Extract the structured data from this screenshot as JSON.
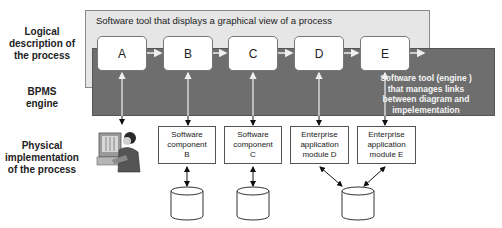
{
  "rows": {
    "logical": "Logical description of the process",
    "logical_lines": [
      "Logical",
      "description of",
      "the process"
    ],
    "engine_lines": [
      "BPMS",
      "engine"
    ],
    "physical_lines": [
      "Physical",
      "implementation",
      "of the process"
    ]
  },
  "tool_panel": {
    "title": "Software tool that displays a graphical view  of a process"
  },
  "engine": {
    "description_lines": [
      "Software tool  (engine )",
      "that manages links",
      "between diagram and",
      "impelementation"
    ]
  },
  "steps": [
    {
      "label": "A"
    },
    {
      "label": "B"
    },
    {
      "label": "C"
    },
    {
      "label": "D"
    },
    {
      "label": "E"
    }
  ],
  "implementations": [
    {
      "id": "A",
      "type": "human-user",
      "icon": "person-at-computer-icon"
    },
    {
      "id": "B",
      "lines": [
        "Software",
        "component",
        "B"
      ]
    },
    {
      "id": "C",
      "lines": [
        "Software",
        "component",
        "C"
      ]
    },
    {
      "id": "D",
      "lines": [
        "Enterprise",
        "application",
        "module  D"
      ]
    },
    {
      "id": "E",
      "lines": [
        "Enterprise",
        "application",
        "module  E"
      ]
    }
  ],
  "databases": [
    {
      "linked_to": [
        "B"
      ]
    },
    {
      "linked_to": [
        "C"
      ]
    },
    {
      "linked_to": [
        "D",
        "E"
      ]
    }
  ],
  "colors": {
    "tool_panel_bg": "#e6e6e6",
    "engine_band_bg": "#6e6e6e",
    "box_bg": "#ffffff",
    "engine_text": "#f4f4f4"
  }
}
